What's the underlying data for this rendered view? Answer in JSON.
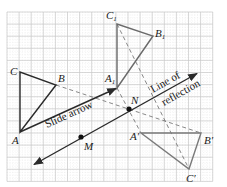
{
  "diagram": {
    "grid": {
      "x0": 7,
      "y0": 12,
      "cols": 17,
      "rows": 14,
      "spacing": 12.1,
      "color": "#c8c8c8"
    },
    "original_triangle": {
      "color": "#2a2a2a",
      "vertices": {
        "A": [
          20,
          132
        ],
        "B": [
          56,
          85
        ],
        "C": [
          20,
          72
        ]
      },
      "labels": {
        "A": "A",
        "B": "B",
        "C": "C"
      }
    },
    "slid_triangle": {
      "color": "#6a6a6a",
      "vertices": {
        "A1": [
          117,
          88
        ],
        "B1": [
          153,
          36
        ],
        "C1": [
          117,
          24
        ]
      },
      "labels": {
        "A1": "A",
        "B1": "B",
        "C1": "C",
        "sub": "1"
      }
    },
    "reflected_triangle": {
      "color": "#7a7a7a",
      "vertices": {
        "A'": [
          141,
          133
        ],
        "B'": [
          201,
          133
        ],
        "C'": [
          189,
          169
        ]
      },
      "labels": {
        "A'": "A′",
        "B'": "B′",
        "C'": "C′"
      }
    },
    "slide_arrow": {
      "from": [
        20,
        132
      ],
      "to": [
        117,
        88
      ],
      "label": "Slide arrow"
    },
    "line_of_reflection": {
      "from": [
        33,
        165
      ],
      "to": [
        198,
        73
      ],
      "label_line1": "Line of",
      "label_line2": "reflection"
    },
    "points": {
      "M": {
        "pos": [
          81,
          137
        ],
        "label": "M"
      },
      "N": {
        "pos": [
          129,
          109
        ],
        "label": "N"
      }
    },
    "dashed_lines": [
      {
        "from": [
          56,
          85
        ],
        "to": [
          201,
          133
        ]
      },
      {
        "from": [
          117,
          24
        ],
        "to": [
          189,
          169
        ]
      },
      {
        "from": [
          117,
          88
        ],
        "to": [
          141,
          133
        ]
      }
    ]
  }
}
